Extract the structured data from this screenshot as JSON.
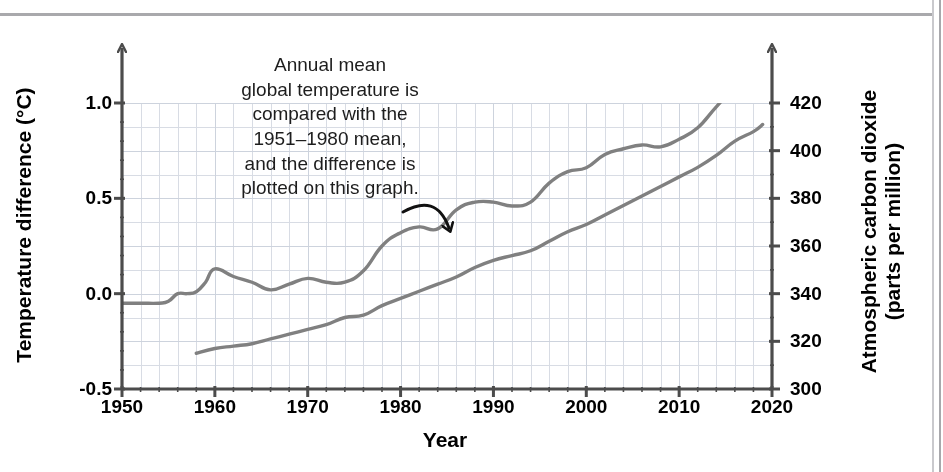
{
  "figure": {
    "annotation": "Annual mean global temperature is compared with the 1951–1980 mean, and the difference is plotted on this graph.",
    "annotation_lines": [
      "Annual mean",
      "global temperature is",
      "compared with the",
      "1951–1980 mean,",
      "and the difference is",
      "plotted on this graph."
    ],
    "axis_titles": {
      "x": "Year",
      "y_left": "Temperature difference (°C)",
      "y_right_line1": "Atmospheric carbon dioxide",
      "y_right_line2": "(parts per million)"
    },
    "ticks": {
      "x": [
        "1950",
        "1960",
        "1970",
        "1980",
        "1990",
        "2000",
        "2010",
        "2020"
      ],
      "y_left": [
        "1.0",
        "0.5",
        "0.0",
        "-0.5"
      ],
      "y_right": [
        "420",
        "400",
        "380",
        "360",
        "340",
        "320",
        "300"
      ]
    },
    "colors": {
      "line": "#808080",
      "grid": "#d8dce4",
      "axis": "#4c4c4c",
      "arrow": "#111111",
      "text": "#000000"
    }
  },
  "chart_data": {
    "type": "line",
    "title": "",
    "xlabel": "Year",
    "ylabel": "Temperature difference (°C)",
    "ylabel_secondary": "Atmospheric carbon dioxide (parts per million)",
    "xlim": [
      1950,
      2020
    ],
    "ylim": [
      -0.5,
      1.15
    ],
    "ylim_secondary": [
      300,
      426
    ],
    "grid": true,
    "legend": "none",
    "annotations": [
      {
        "text": "Annual mean global temperature is compared with the 1951–1980 mean, and the difference is plotted on this graph.",
        "arrow_from_x": 1984,
        "arrow_from_y": 0.52,
        "arrow_to_x": 1985,
        "arrow_to_y": 0.4
      }
    ],
    "series": [
      {
        "name": "Temperature difference (°C)",
        "axis": "left",
        "units": "°C",
        "x": [
          1950,
          1952,
          1954,
          1955,
          1956,
          1957,
          1958,
          1959,
          1960,
          1962,
          1964,
          1966,
          1968,
          1970,
          1972,
          1974,
          1976,
          1978,
          1980,
          1982,
          1984,
          1986,
          1988,
          1990,
          1992,
          1994,
          1996,
          1998,
          2000,
          2002,
          2004,
          2006,
          2008,
          2010,
          2012,
          2014,
          2016,
          2018,
          2019
        ],
        "values": [
          -0.05,
          -0.05,
          -0.05,
          -0.04,
          0.0,
          0.0,
          0.01,
          0.06,
          0.13,
          0.09,
          0.06,
          0.02,
          0.05,
          0.08,
          0.06,
          0.06,
          0.12,
          0.25,
          0.32,
          0.35,
          0.34,
          0.44,
          0.48,
          0.48,
          0.46,
          0.48,
          0.58,
          0.64,
          0.66,
          0.73,
          0.76,
          0.78,
          0.77,
          0.81,
          0.87,
          0.98,
          1.08,
          1.13,
          1.15
        ]
      },
      {
        "name": "Atmospheric carbon dioxide (ppm)",
        "axis": "right",
        "units": "ppm",
        "x": [
          1958,
          1960,
          1962,
          1964,
          1966,
          1968,
          1970,
          1972,
          1974,
          1976,
          1978,
          1980,
          1982,
          1984,
          1986,
          1988,
          1990,
          1992,
          1994,
          1996,
          1998,
          2000,
          2002,
          2004,
          2006,
          2008,
          2010,
          2012,
          2014,
          2016,
          2018,
          2019
        ],
        "values": [
          315,
          317,
          318,
          319,
          321,
          323,
          325,
          327,
          330,
          331,
          335,
          338,
          341,
          344,
          347,
          351,
          354,
          356,
          358,
          362,
          366,
          369,
          373,
          377,
          381,
          385,
          389,
          393,
          398,
          404,
          408,
          411
        ]
      }
    ]
  }
}
